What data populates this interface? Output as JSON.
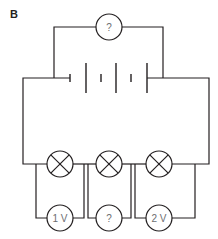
{
  "figure": {
    "label": "B"
  },
  "top_meter": {
    "label": "?"
  },
  "battery": {
    "cells": 3
  },
  "lamps": [
    {
      "id": "lamp-1"
    },
    {
      "id": "lamp-2"
    },
    {
      "id": "lamp-3"
    }
  ],
  "voltmeters": [
    {
      "label": "1 V"
    },
    {
      "label": "?"
    },
    {
      "label": "2 V"
    }
  ],
  "colors": {
    "wire": "#231f20",
    "label_text": "#6d6e71",
    "background": "#ffffff"
  }
}
